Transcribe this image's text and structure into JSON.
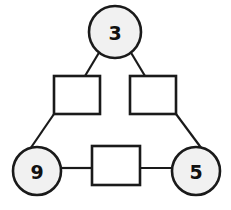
{
  "diagram": {
    "type": "triangle-number-puzzle",
    "background_color": "#ffffff",
    "stroke_color": "#1a1a1a",
    "circle_fill": "#f1f1f1",
    "box_fill": "#ffffff",
    "circles": [
      {
        "id": "circle-top",
        "label": "3",
        "cx": 115,
        "cy": 32,
        "r": 26,
        "position": "top"
      },
      {
        "id": "circle-bottom-left",
        "label": "9",
        "cx": 37,
        "cy": 171,
        "r": 24,
        "position": "bottom-left"
      },
      {
        "id": "circle-bottom-right",
        "label": "5",
        "cx": 196,
        "cy": 171,
        "r": 24,
        "position": "bottom-right"
      }
    ],
    "boxes": [
      {
        "id": "box-left",
        "label": "",
        "x": 54,
        "y": 76,
        "width": 46,
        "height": 38,
        "position": "upper-left"
      },
      {
        "id": "box-right",
        "label": "",
        "x": 130,
        "y": 76,
        "width": 46,
        "height": 38,
        "position": "upper-right"
      },
      {
        "id": "box-bottom",
        "label": "",
        "x": 92,
        "y": 146,
        "width": 48,
        "height": 39,
        "position": "bottom-center"
      }
    ],
    "edges": [
      {
        "id": "edge-top-to-box-left",
        "from": "circle-top",
        "to": "box-left",
        "x1": 100,
        "y1": 51,
        "x2": 85,
        "y2": 76
      },
      {
        "id": "edge-top-to-box-right",
        "from": "circle-top",
        "to": "box-right",
        "x1": 130,
        "y1": 51,
        "x2": 145,
        "y2": 76
      },
      {
        "id": "edge-box-left-to-circle-left",
        "from": "box-left",
        "to": "circle-bottom-left",
        "x1": 54,
        "y1": 114,
        "x2": 30,
        "y2": 149
      },
      {
        "id": "edge-box-right-to-circle-right",
        "from": "box-right",
        "to": "circle-bottom-right",
        "x1": 176,
        "y1": 114,
        "x2": 202,
        "y2": 149
      },
      {
        "id": "edge-circle-left-to-box-bottom",
        "from": "circle-bottom-left",
        "to": "box-bottom",
        "x1": 61,
        "y1": 168,
        "x2": 92,
        "y2": 168
      },
      {
        "id": "edge-box-bottom-to-circle-right",
        "from": "box-bottom",
        "to": "circle-bottom-right",
        "x1": 140,
        "y1": 168,
        "x2": 173,
        "y2": 168
      }
    ],
    "stroke_widths": {
      "circle": 2.6,
      "box": 2.6,
      "edge": 2.2
    }
  }
}
